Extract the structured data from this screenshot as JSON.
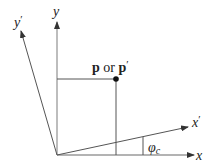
{
  "diagram": {
    "type": "coordinate-rotation",
    "colors": {
      "axis": "#9a9a9a",
      "rotated_axis": "#555555",
      "point": "#111111",
      "text": "#222222"
    },
    "labels": {
      "x": "x",
      "y": "y",
      "x_prime": "x",
      "y_prime": "y",
      "prime": "′",
      "point_p": "p",
      "or": " or ",
      "point_p_prime": "p",
      "angle": "φ",
      "angle_sub": "c"
    }
  }
}
